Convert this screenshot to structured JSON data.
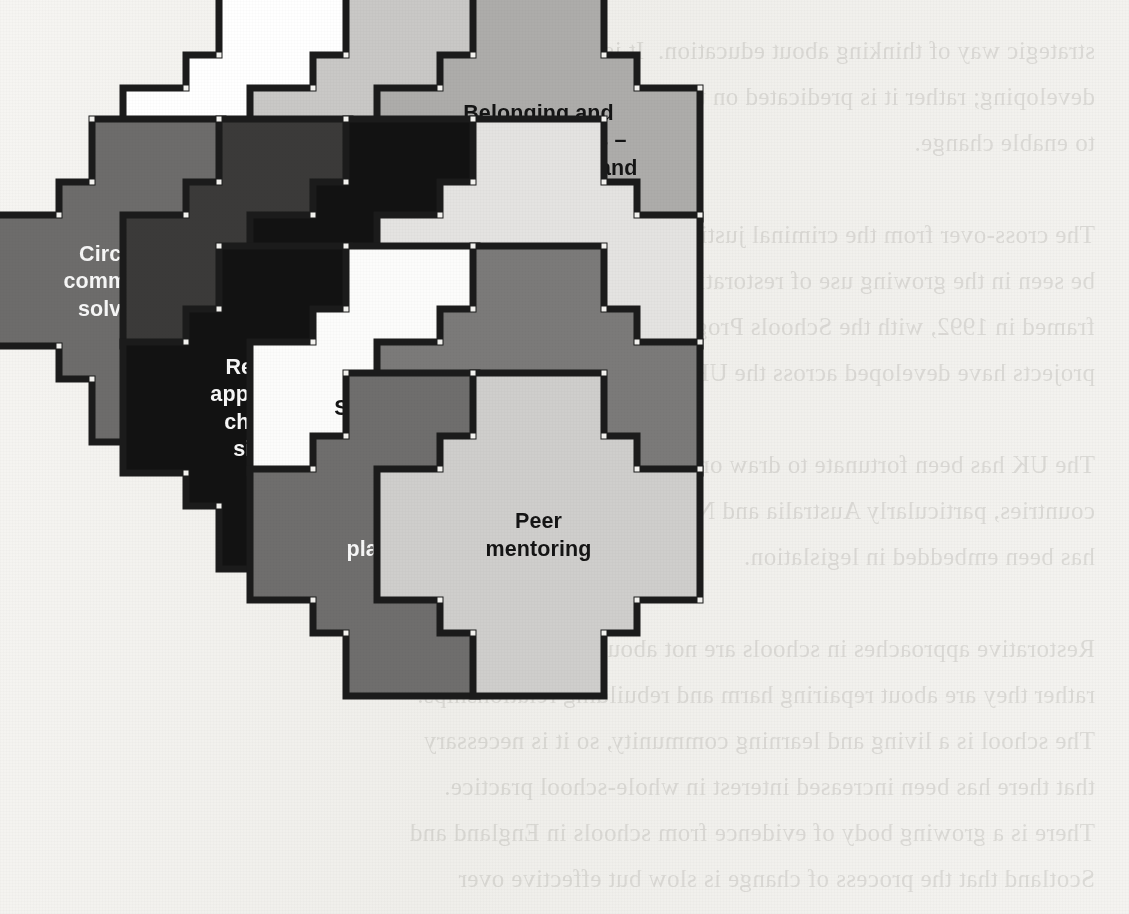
{
  "document": {
    "type": "scanned-book-page",
    "figure_name": "restorative-practice-jigsaw",
    "background_color": "#f3f2ef",
    "outline_color": "#1b1b1b",
    "page_bleed_text": "strategic way of thinking about education.  It is not merely a set of\ndeveloping; rather it is predicated on the idea that we use our power\nto enable change.\n\nThe cross-over from the criminal justice arena into schools can\nbe seen in the growing use of restorative approaches in education,\nframed in 1992, with the Schools Programme.  A number of similar\nprojects have developed across the UK since then.\n\nThe UK has been fortunate to draw on the experience of other\ncountries, particularly Australia and New Zealand, where change\nhas been embedded in legislation.\n\nRestorative approaches in schools are not about punishment:\nrather they are about repairing harm and rebuilding relationships.\nThe school is a living and learning community, so it is necessary\nthat there has been increased interest in whole-school practice.\nThere is a growing body of evidence from schools in England and\nScotland that the process of change is slow but effective over\ntime.  An evaluation published in 2007 by the Scottish Executive\nConcluded that restorative practices were improving the reported\nbehaviour of pupils and strengthening relationship and community.\n(Scottish Executive Education Department, 2007.)"
  },
  "figure": {
    "grid": {
      "pitch_x": 127,
      "pitch_y": 127,
      "body": 197,
      "tab": 131,
      "origin_x": 59,
      "origin_y": 55
    },
    "pieces": [
      {
        "id": "ethos",
        "label": "An ethos of\ncare and justice",
        "col": 1,
        "row": 0,
        "fill": "#ffffff",
        "text_color": "#141414"
      },
      {
        "id": "listening",
        "label": "A listening\nschool",
        "col": 2,
        "row": 0,
        "fill": "#c9c8c6",
        "text_color": "#141414"
      },
      {
        "id": "belonging",
        "label": "Belonging and\nconnectedness –\ninclusive skills and\nstrategies",
        "col": 3,
        "row": 0,
        "fill": "#adacaa",
        "text_color": "#141414"
      },
      {
        "id": "circles",
        "label": "Circles to build\ncommunity and/or\nsolve problems",
        "col": 0,
        "row": 1,
        "fill": "#6d6c6b",
        "text_color": "#f7f7f7"
      },
      {
        "id": "mediation",
        "label": "Mediation\nfor/by\nall ages",
        "col": 1,
        "row": 1,
        "fill": "#3b3a39",
        "text_color": "#f7f7f7"
      },
      {
        "id": "relationship",
        "label": "Relationship\nmanagement\npolicy",
        "col": 2,
        "row": 1,
        "fill": "#121212",
        "text_color": "#f7f7f7"
      },
      {
        "id": "emotional",
        "label": "Emotional\nliteracy",
        "col": 3,
        "row": 1,
        "fill": "#e4e3e1",
        "text_color": "#141414"
      },
      {
        "id": "restorative",
        "label": "Restorative\napproaches to\nchallenging\nsituations",
        "col": 1,
        "row": 2,
        "fill": "#121212",
        "text_color": "#f7f7f7"
      },
      {
        "id": "school-council",
        "label": "School council",
        "col": 2,
        "row": 2,
        "fill": "#fcfcfb",
        "text_color": "#141414"
      },
      {
        "id": "question",
        "label": "?",
        "col": 3,
        "row": 2,
        "fill": "#7b7a79",
        "text_color": "#121212",
        "is_question": true
      },
      {
        "id": "playgrounds",
        "label": "Happy\nplaygrounds",
        "col": 2,
        "row": 3,
        "fill": "#6f6e6d",
        "text_color": "#f7f7f7"
      },
      {
        "id": "peer",
        "label": "Peer\nmentoring",
        "col": 3,
        "row": 3,
        "fill": "#cfcecc",
        "text_color": "#141414"
      }
    ]
  }
}
